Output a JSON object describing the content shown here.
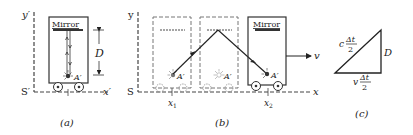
{
  "figure": {
    "panel_a": {
      "caption": "(a)",
      "axis_y": "y′",
      "axis_x": "x′",
      "origin": "S′",
      "mirror_label": "Mirror",
      "distance_label": "D",
      "source_label": "A′"
    },
    "panel_b": {
      "caption": "(b)",
      "axis_y": "y",
      "axis_x": "x",
      "origin": "S",
      "mirror_label": "Mirror",
      "source_label": "A′",
      "x1_label": "x",
      "x1_sub": "1",
      "x2_label": "x",
      "x2_sub": "2",
      "velocity_label": "v"
    },
    "panel_c": {
      "caption": "(c)",
      "hyp_prefix": "c",
      "base_prefix": "v",
      "frac_num": "Δt",
      "frac_den": "2",
      "side_label": "D"
    },
    "colors": {
      "ink": "#222222",
      "dash": "#555555",
      "ghost": "#8a8a8a",
      "background": "#ffffff"
    }
  }
}
